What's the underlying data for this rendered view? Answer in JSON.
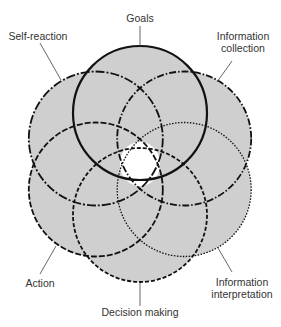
{
  "diagram": {
    "center": [
      140,
      164
    ],
    "offset": 51,
    "radius": 67,
    "fill_color": "#cfcfcf",
    "hole_color": "#ffffff",
    "stroke_color": "#111111",
    "leader_color": "#555555",
    "circles": [
      {
        "id": "goals",
        "label": "Goals",
        "angle": -90,
        "style": "solid"
      },
      {
        "id": "information-collection",
        "label": "Information collection",
        "angle": -30,
        "style": "dash-dot"
      },
      {
        "id": "information-interpretation",
        "label": "Information interpretation",
        "angle": 30,
        "style": "dotted"
      },
      {
        "id": "decision-making",
        "label": "Decision making",
        "angle": 90,
        "style": "dashed"
      },
      {
        "id": "action",
        "label": "Action",
        "angle": 150,
        "style": "long-dash"
      },
      {
        "id": "self-reaction",
        "label": "Self-reaction",
        "angle": 210,
        "style": "dash-dot-long"
      }
    ]
  },
  "labels": {
    "goals": "Goals",
    "self_reaction": "Self-reaction",
    "information_collection_1": "Information",
    "information_collection_2": "collection",
    "action": "Action",
    "information_interpretation_1": "Information",
    "information_interpretation_2": "interpretation",
    "decision_making": "Decision making"
  }
}
